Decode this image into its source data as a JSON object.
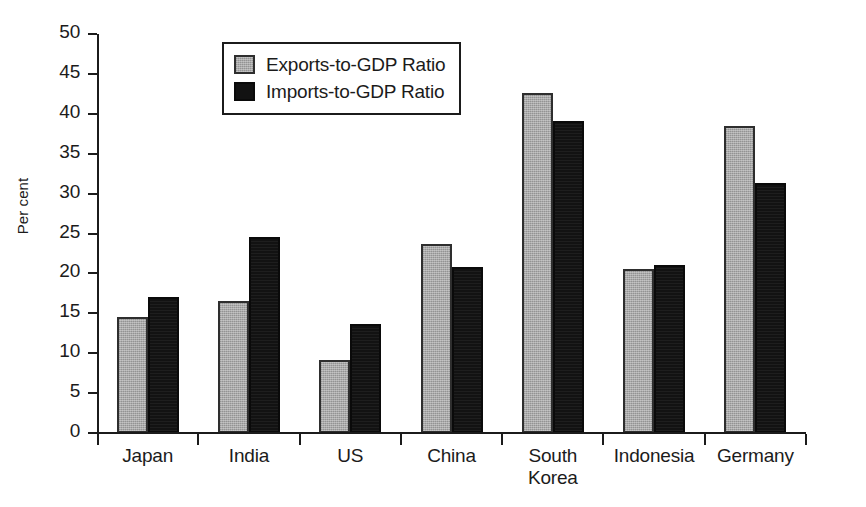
{
  "chart_data": {
    "type": "bar",
    "title": "",
    "xlabel": "",
    "ylabel": "Per cent",
    "ylim": [
      0,
      50
    ],
    "yticks": [
      0,
      5,
      10,
      15,
      20,
      25,
      30,
      35,
      40,
      45,
      50
    ],
    "ytick_labels": [
      "0",
      "5",
      "10",
      "15",
      "20",
      "25",
      "30",
      "35",
      "40",
      "45",
      "50"
    ],
    "grid": false,
    "legend_position": "upper left inside",
    "categories": [
      "Japan",
      "India",
      "US",
      "China",
      "South\nKorea",
      "Indonesia",
      "Germany"
    ],
    "series": [
      {
        "name": "Exports-to-GDP Ratio",
        "color": "#a9a9a9",
        "values": [
          14.5,
          16.6,
          9.1,
          23.7,
          42.6,
          20.6,
          38.5
        ]
      },
      {
        "name": "Imports-to-GDP Ratio",
        "color": "#121212",
        "values": [
          17.0,
          24.6,
          13.7,
          20.8,
          39.1,
          21.1,
          31.3
        ]
      }
    ]
  },
  "legend": {
    "items": [
      {
        "label": "Exports-to-GDP Ratio",
        "swatch": "gray-swatch"
      },
      {
        "label": "Imports-to-GDP Ratio",
        "swatch": "black-swatch"
      }
    ]
  },
  "axes": {
    "y_title": "Per cent"
  }
}
